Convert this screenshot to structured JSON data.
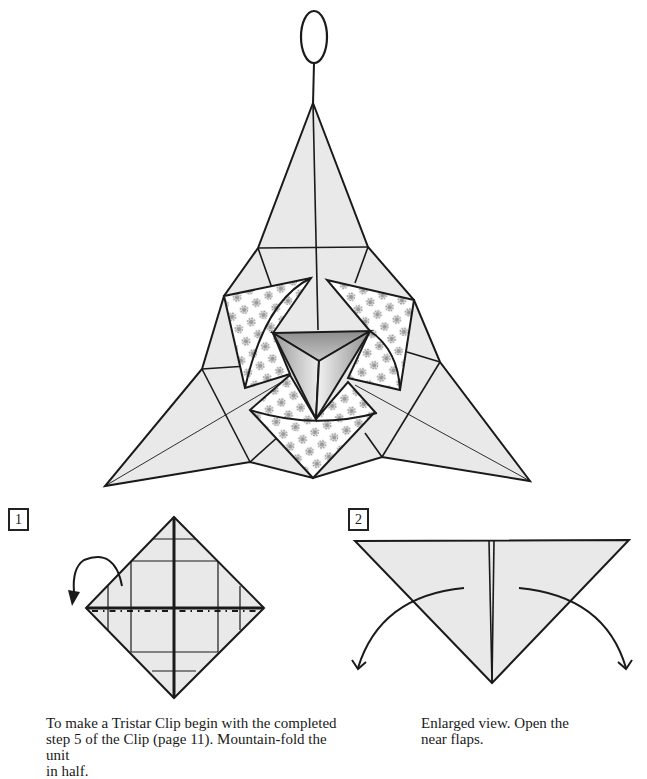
{
  "page": {
    "colors": {
      "paper": "#e9e9e9",
      "line": "#1a1a1a",
      "pattern_bg": "#ffffff",
      "pattern_flower": "#9a9a9a",
      "pyramid_dark": "#8a8a8a",
      "pyramid_light": "#f2f2f2"
    }
  },
  "hero": {
    "label": "Tristar Clip finished model",
    "hanging_loop_icon": "ellipse-loop"
  },
  "steps": [
    {
      "number": "1",
      "diagram": "square-base-diamond",
      "arrow_icon": "mountain-fold-arrow",
      "caption": "To make a Tristar Clip begin with the completed\nstep 5 of the Clip (page 11). Mountain-fold the unit\nin half."
    },
    {
      "number": "2",
      "diagram": "triangle-open-flaps",
      "arrow_icon": "open-flaps-arrows",
      "caption": "Enlarged view. Open the\nnear flaps."
    }
  ]
}
